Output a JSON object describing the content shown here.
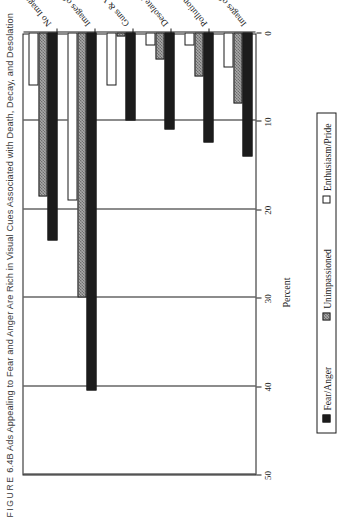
{
  "figure": {
    "label_prefix": "FIGURE",
    "number": "6.4B",
    "title": "Ads Appealing to Fear and Anger Are Rich in Visual Cues Associated with Death, Decay, and Desolation",
    "full_title": "FIGURE 6.4B Ads Appealing to Fear and Anger Are Rich in Visual Cues Associated with Death, Decay, and Desolation"
  },
  "chart_data": {
    "type": "bar",
    "orientation": "horizontal",
    "title": "Ads Appealing to Fear and Anger Are Rich in Visual Cues Associated with Death, Decay, and Desolation",
    "xlabel": "Percent",
    "ylabel": "",
    "xlim": [
      0,
      50
    ],
    "xticks": [
      0,
      10,
      20,
      30,
      40,
      50
    ],
    "xtick_labels": [
      "0",
      "10",
      "20",
      "30",
      "40",
      "50"
    ],
    "grid": true,
    "legend_position": "bottom",
    "categories": [
      "No Images of People",
      "Images of Mostly Elderly",
      "Guns & Violent Crime",
      "Desolate Landscapes",
      "Pollution",
      "Images of War"
    ],
    "series": [
      {
        "name": "Fear/Anger",
        "color": "#1c1c1c",
        "fill": "solid-black",
        "values": [
          23.5,
          40.5,
          10.0,
          11.0,
          12.5,
          14.0
        ]
      },
      {
        "name": "Unimpassioned",
        "color": "#a8a8a8",
        "fill": "gray-hatch",
        "values": [
          18.5,
          30.0,
          0.5,
          3.0,
          5.0,
          8.0
        ]
      },
      {
        "name": "Enthusiasm/Pride",
        "color": "#ffffff",
        "fill": "white-outline",
        "values": [
          6.0,
          19.0,
          6.0,
          1.5,
          1.5,
          4.0
        ]
      }
    ]
  },
  "axis": {
    "value_axis_title": "Percent",
    "tick_labels": [
      "50",
      "40",
      "30",
      "20",
      "10",
      "0"
    ]
  },
  "legend": {
    "items": [
      {
        "label": "Fear/Anger",
        "swatch": "solid-black-swatch"
      },
      {
        "label": "Unimpassioned",
        "swatch": "gray-hatch-swatch"
      },
      {
        "label": "Enthusiasm/Pride",
        "swatch": "white-outline-swatch"
      }
    ]
  }
}
